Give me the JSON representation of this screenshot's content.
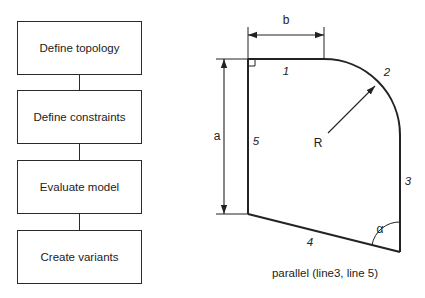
{
  "flowchart": {
    "steps": [
      {
        "label": "Define topology"
      },
      {
        "label": "Define constraints"
      },
      {
        "label": "Evaluate model"
      },
      {
        "label": "Create variants"
      }
    ]
  },
  "sketch": {
    "dimension_labels": {
      "a": "a",
      "b": "b",
      "radius": "R",
      "angle": "α"
    },
    "line_labels": {
      "l1": "1",
      "l2": "2",
      "l3": "3",
      "l4": "4",
      "l5": "5"
    },
    "constraint_caption": "parallel (line3, line 5)",
    "colors": {
      "stroke": "#222222",
      "background": "#ffffff"
    }
  }
}
